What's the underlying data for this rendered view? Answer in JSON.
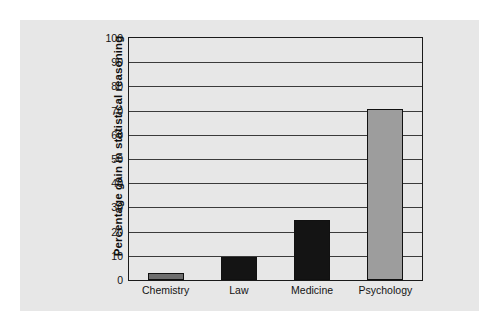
{
  "figure": {
    "background_color": "#ffffff",
    "panel_color": "#e7e7e7"
  },
  "chart_data": {
    "type": "bar",
    "title": "",
    "xlabel": "",
    "ylabel": "Percentage gain in statistical reasoning",
    "categories": [
      "Chemistry",
      "Law",
      "Medicine",
      "Psychology"
    ],
    "values": [
      3,
      9.5,
      25,
      70.5
    ],
    "series": [
      {
        "name": "Percentage gain in statistical reasoning",
        "values": [
          3,
          9.5,
          25,
          70.5
        ]
      }
    ],
    "bar_colors": [
      "#6e6e6e",
      "#141414",
      "#141414",
      "#9d9d9d"
    ],
    "ylim": [
      0,
      100
    ],
    "yticks": [
      0,
      10,
      20,
      30,
      40,
      50,
      60,
      70,
      80,
      90,
      100
    ],
    "ytick_labels": [
      "0",
      "10",
      "20",
      "30",
      "40",
      "50",
      "60",
      "70",
      "80",
      "90",
      "100"
    ],
    "grid": true,
    "grid_axis": "y",
    "legend": false,
    "legend_position": "none",
    "axis_color": "#1a1a1a",
    "gridline_color": "#3b3b3b"
  }
}
